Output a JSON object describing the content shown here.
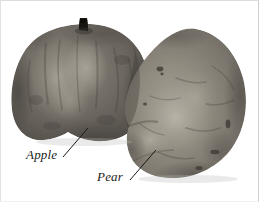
{
  "figure": {
    "kind": "grayscale-photograph",
    "background_color": "#ffffff",
    "frame_color": "#cfcfd2",
    "width_px": 265,
    "height_px": 203
  },
  "annotations": [
    {
      "id": "apple",
      "label": "Apple",
      "text_color": "#1c1c1c",
      "leader_color": "#1a1a1a",
      "leader": {
        "x1": 63,
        "y1": 157,
        "x2": 88,
        "y2": 128
      }
    },
    {
      "id": "pear",
      "label": "Pear",
      "text_color": "#1c1c1c",
      "leader_color": "#1a1a1a",
      "leader": {
        "x1": 130,
        "y1": 180,
        "x2": 156,
        "y2": 150
      }
    }
  ],
  "subjects": {
    "apple": {
      "name": "Apple",
      "icon_name": "apple-fruit-shape",
      "fill_dark": "#4b4742",
      "fill_mid": "#6d6860",
      "fill_light": "#928c82",
      "stem_color": "#17150f"
    },
    "pear": {
      "name": "Pear",
      "icon_name": "pear-fruit-shape",
      "fill_dark": "#5e5a54",
      "fill_mid": "#857f77",
      "fill_light": "#aaa49a",
      "blemish_color": "#36332e"
    }
  },
  "labels": {
    "apple": "Apple",
    "pear": "Pear"
  }
}
